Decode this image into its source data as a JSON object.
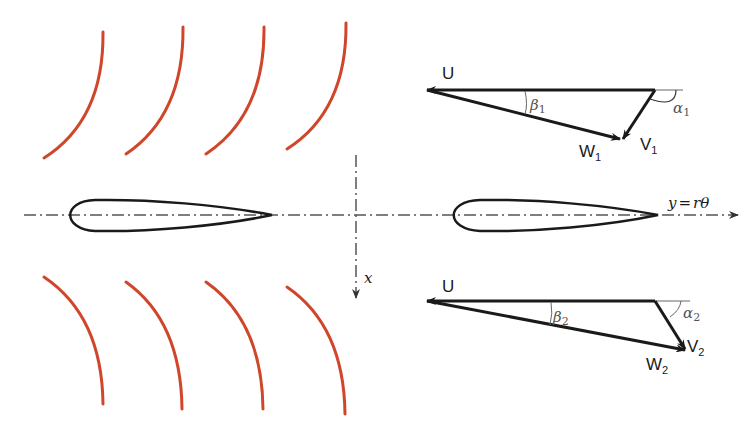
{
  "diagram": {
    "title": "",
    "colors": {
      "blade": "#d0462a",
      "line": "#1a1a1a",
      "centerline": "#555555",
      "angle_label": "#555555"
    },
    "axes": {
      "y_axis_label": "y = rθ",
      "y_label_y": "y",
      "y_label_eq": "=",
      "y_label_r": "r",
      "y_label_theta": "θ",
      "x_axis_label": "x"
    },
    "inlet_triangle": {
      "U_label": "U",
      "W_label": "W",
      "W_sub": "1",
      "V_label": "V",
      "V_sub": "1",
      "beta_label": "β",
      "beta_sub": "1",
      "alpha_label": "α",
      "alpha_sub": "1"
    },
    "outlet_triangle": {
      "U_label": "U",
      "W_label": "W",
      "W_sub": "2",
      "V_label": "V",
      "V_sub": "2",
      "beta_label": "β",
      "beta_sub": "2",
      "alpha_label": "α",
      "alpha_sub": "2"
    },
    "upper_blades_count": 4,
    "lower_blades_count": 4,
    "airfoils_count": 2
  }
}
